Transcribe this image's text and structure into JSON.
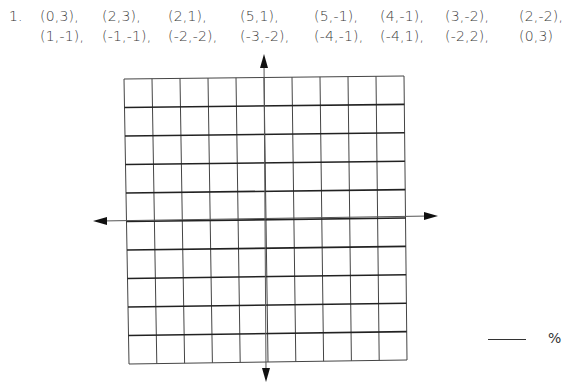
{
  "problem": {
    "number": "1.",
    "points": [
      "(0,3),",
      "(2,3),",
      "(2,1),",
      "(5,1),",
      "(5,-1),",
      "(4,-1),",
      "(3,-2),",
      "(2,-2),",
      "(1,-1),",
      "(-1,-1),",
      "(-2,-2),",
      "(-3,-2),",
      "(-4,-1),",
      "(-4,1),",
      "(-2,2),",
      "(0,3)"
    ]
  },
  "grid": {
    "columns": 10,
    "rows": 10,
    "x_axis_arrows": "left-right",
    "y_axis_arrows": "up-down",
    "line_color": "#333333"
  },
  "answer": {
    "blank": "",
    "suffix": "%"
  }
}
